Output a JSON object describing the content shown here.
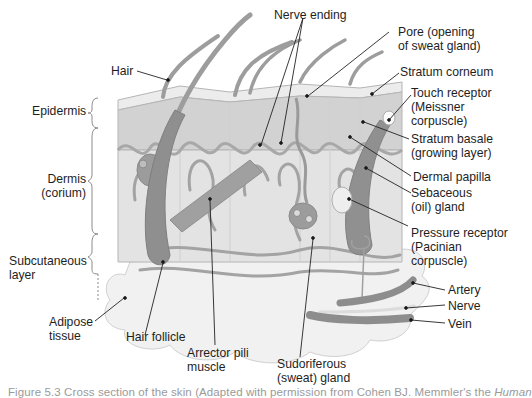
{
  "figure": {
    "title": "Cross section of the skin",
    "colors": {
      "background": "#ffffff",
      "tissue_light": "#e6e6e6",
      "tissue_mid": "#c9c9c9",
      "tissue_dark": "#9a9a9a",
      "structure_dark": "#8a8a8a",
      "label_text": "#1e1e1e",
      "caption_text": "#9a9a9a"
    },
    "labels": {
      "hair": "Hair",
      "nerve_ending": "Nerve ending",
      "pore_line1": "Pore (opening",
      "pore_line2": "of sweat gland)",
      "stratum_corneum": "Stratum corneum",
      "touch_receptor_line1": "Touch receptor",
      "touch_receptor_line2": "(Meissner",
      "touch_receptor_line3": "corpuscle)",
      "stratum_basale_line1": "Stratum basale",
      "stratum_basale_line2": "(growing layer)",
      "dermal_papilla": "Dermal papilla",
      "sebaceous_line1": "Sebaceous",
      "sebaceous_line2": "(oil) gland",
      "pressure_receptor_line1": "Pressure receptor",
      "pressure_receptor_line2": "(Pacinian",
      "pressure_receptor_line3": "corpuscle)",
      "artery": "Artery",
      "nerve": "Nerve",
      "vein": "Vein",
      "sudoriferous_line1": "Sudoriferous",
      "sudoriferous_line2": "(sweat) gland",
      "arrector_line1": "Arrector pili",
      "arrector_line2": "muscle",
      "hair_follicle": "Hair follicle",
      "adipose_line1": "Adipose",
      "adipose_line2": "tissue",
      "epidermis": "Epidermis",
      "dermis_line1": "Dermis",
      "dermis_line2": "(corium)",
      "subcutaneous_line1": "Subcutaneous",
      "subcutaneous_line2": "layer"
    },
    "caption": {
      "prefix": "Figure 5.3",
      "text": " Cross section of the skin (Adapted with permission from Cohen BJ. Memmler's the ",
      "italic": "Human"
    }
  }
}
